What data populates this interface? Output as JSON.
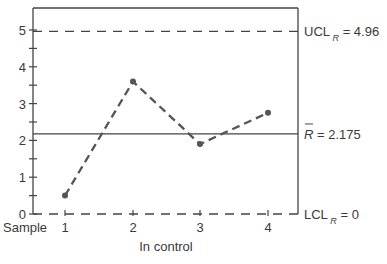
{
  "chart_data": {
    "type": "line",
    "title": "",
    "xlabel": "In control",
    "ylabel": "",
    "x_axis_prefix": "Sample",
    "categories": [
      "1",
      "2",
      "3",
      "4"
    ],
    "series": [
      {
        "name": "Sample range R",
        "values": [
          0.5,
          3.6,
          1.9,
          2.75
        ]
      }
    ],
    "ylim": [
      0,
      5.5
    ],
    "yticks": [
      "0",
      "1",
      "2",
      "3",
      "4",
      "5"
    ],
    "grid": false,
    "reference_lines": [
      {
        "name": "UCL_R",
        "label_main": "UCL",
        "label_sub": "R",
        "label_value": " = 4.96",
        "value": 4.96,
        "style": "dashed"
      },
      {
        "name": "R_bar",
        "label_main": "R",
        "label_value": " = 2.175",
        "value": 2.175,
        "style": "solid"
      },
      {
        "name": "LCL_R",
        "label_main": "LCL",
        "label_sub": "R",
        "label_value": " = 0",
        "value": 0,
        "style": "dashed"
      }
    ],
    "annotations": [
      "In control"
    ]
  }
}
